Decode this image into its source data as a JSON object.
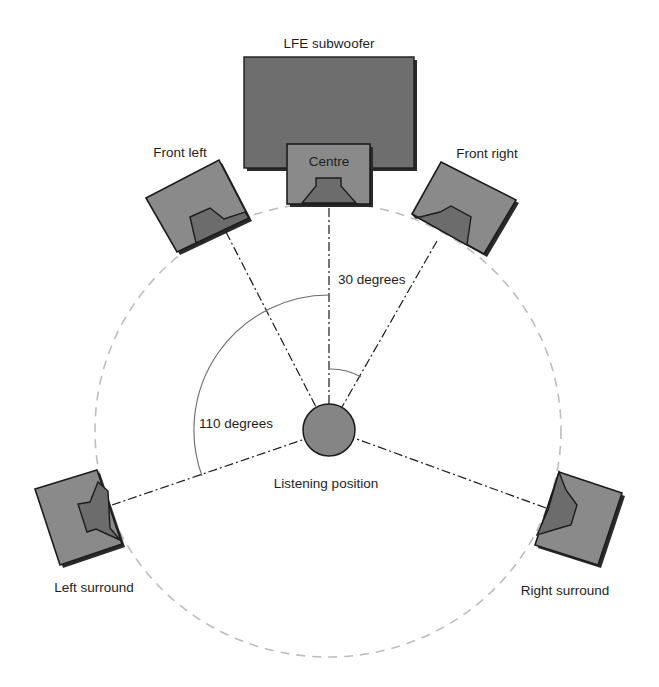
{
  "diagram": {
    "type": "surround-sound-speaker-layout",
    "labels": {
      "subwoofer": "LFE subwoofer",
      "centre": "Centre",
      "front_left": "Front left",
      "front_right": "Front right",
      "left_surround": "Left surround",
      "right_surround": "Right surround",
      "listening_position": "Listening position",
      "angle_front": "30 degrees",
      "angle_surround": "110 degrees"
    },
    "angles": {
      "front_degrees": 30,
      "surround_degrees": 110
    },
    "colors": {
      "speaker_fill": "#8a8a8a",
      "horn_fill": "#6c6c6c",
      "subwoofer_fill": "#6e6e6e",
      "outline": "#1c1c1c",
      "ring": "#bdbdbd",
      "background": "#ffffff"
    }
  }
}
